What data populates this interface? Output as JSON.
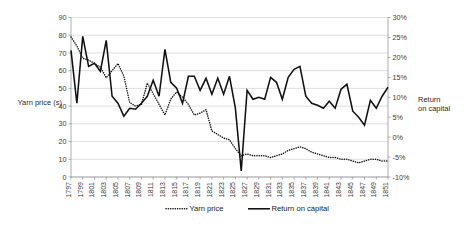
{
  "chart_data": {
    "type": "line",
    "title": "",
    "xlabel": "",
    "ylabel": "Yarn price (s)",
    "ylabel_right": "Return on capital",
    "grid": true,
    "legend_position": "bottom",
    "ylim": [
      0,
      90
    ],
    "ytick_step": 10,
    "ylim_right": [
      -0.1,
      0.3
    ],
    "ytick_step_right": 0.05,
    "yticks": [
      "0",
      "10",
      "20",
      "30",
      "40",
      "50",
      "60",
      "70",
      "80",
      "90"
    ],
    "yticks_right": [
      "-10%",
      "-5%",
      "0%",
      "5%",
      "10%",
      "15%",
      "20%",
      "25%",
      "30%"
    ],
    "x": [
      1797,
      1798,
      1799,
      1800,
      1801,
      1802,
      1803,
      1804,
      1805,
      1806,
      1807,
      1808,
      1809,
      1810,
      1811,
      1812,
      1813,
      1814,
      1815,
      1816,
      1817,
      1818,
      1819,
      1820,
      1821,
      1822,
      1823,
      1824,
      1825,
      1826,
      1827,
      1828,
      1829,
      1830,
      1831,
      1832,
      1833,
      1834,
      1835,
      1836,
      1837,
      1838,
      1839,
      1840,
      1841,
      1842,
      1843,
      1844,
      1845,
      1846,
      1847,
      1848,
      1849,
      1850,
      1851
    ],
    "xtick_labels": [
      "1797",
      "1799",
      "1801",
      "1803",
      "1805",
      "1807",
      "1809",
      "1811",
      "1813",
      "1815",
      "1817",
      "1819",
      "1821",
      "1823",
      "1825",
      "1827",
      "1829",
      "1831",
      "1833",
      "1835",
      "1837",
      "1839",
      "1841",
      "1843",
      "1845",
      "1847",
      "1849",
      "1851"
    ],
    "xtick_step": 2,
    "series": [
      {
        "name": "Yarn price",
        "axis": "left",
        "style": "dotted",
        "color": "#111111",
        "values": [
          79,
          74,
          67,
          66,
          64,
          62,
          56,
          60,
          64,
          57,
          42,
          40,
          41,
          53,
          47,
          41,
          35,
          44,
          48,
          45,
          41,
          35,
          36,
          38,
          26,
          24,
          22,
          21,
          16,
          12,
          13,
          12,
          12,
          12,
          11,
          12,
          13,
          15,
          16,
          17,
          16,
          14,
          13,
          12,
          11,
          11,
          10,
          10,
          9,
          8,
          9,
          10,
          10,
          9,
          9
        ]
      },
      {
        "name": "Return on capital",
        "axis": "right",
        "style": "solid",
        "color": "#111111",
        "values": [
          0.2175,
          0.085,
          0.2525,
          0.1775,
          0.185,
          0.165,
          0.2425,
          0.1025,
          0.085,
          0.0525,
          0.0725,
          0.07,
          0.085,
          0.1025,
          0.1425,
          0.1025,
          0.22,
          0.1375,
          0.1225,
          0.085,
          0.1525,
          0.1525,
          0.1175,
          0.1475,
          0.1075,
          0.1475,
          0.1075,
          0.1525,
          0.0725,
          -0.085,
          0.1175,
          0.095,
          0.1,
          0.095,
          0.15,
          0.1375,
          0.095,
          0.15,
          0.17,
          0.1775,
          0.1025,
          0.085,
          0.08,
          0.0725,
          0.09,
          0.0725,
          0.12,
          0.1325,
          0.065,
          0.05,
          0.03,
          0.0925,
          0.0725,
          0.1025,
          0.125
        ]
      }
    ]
  },
  "legend": {
    "items": [
      {
        "label": "Yarn price",
        "style": "dotted"
      },
      {
        "label": "Return on capital",
        "style": "solid"
      }
    ]
  }
}
